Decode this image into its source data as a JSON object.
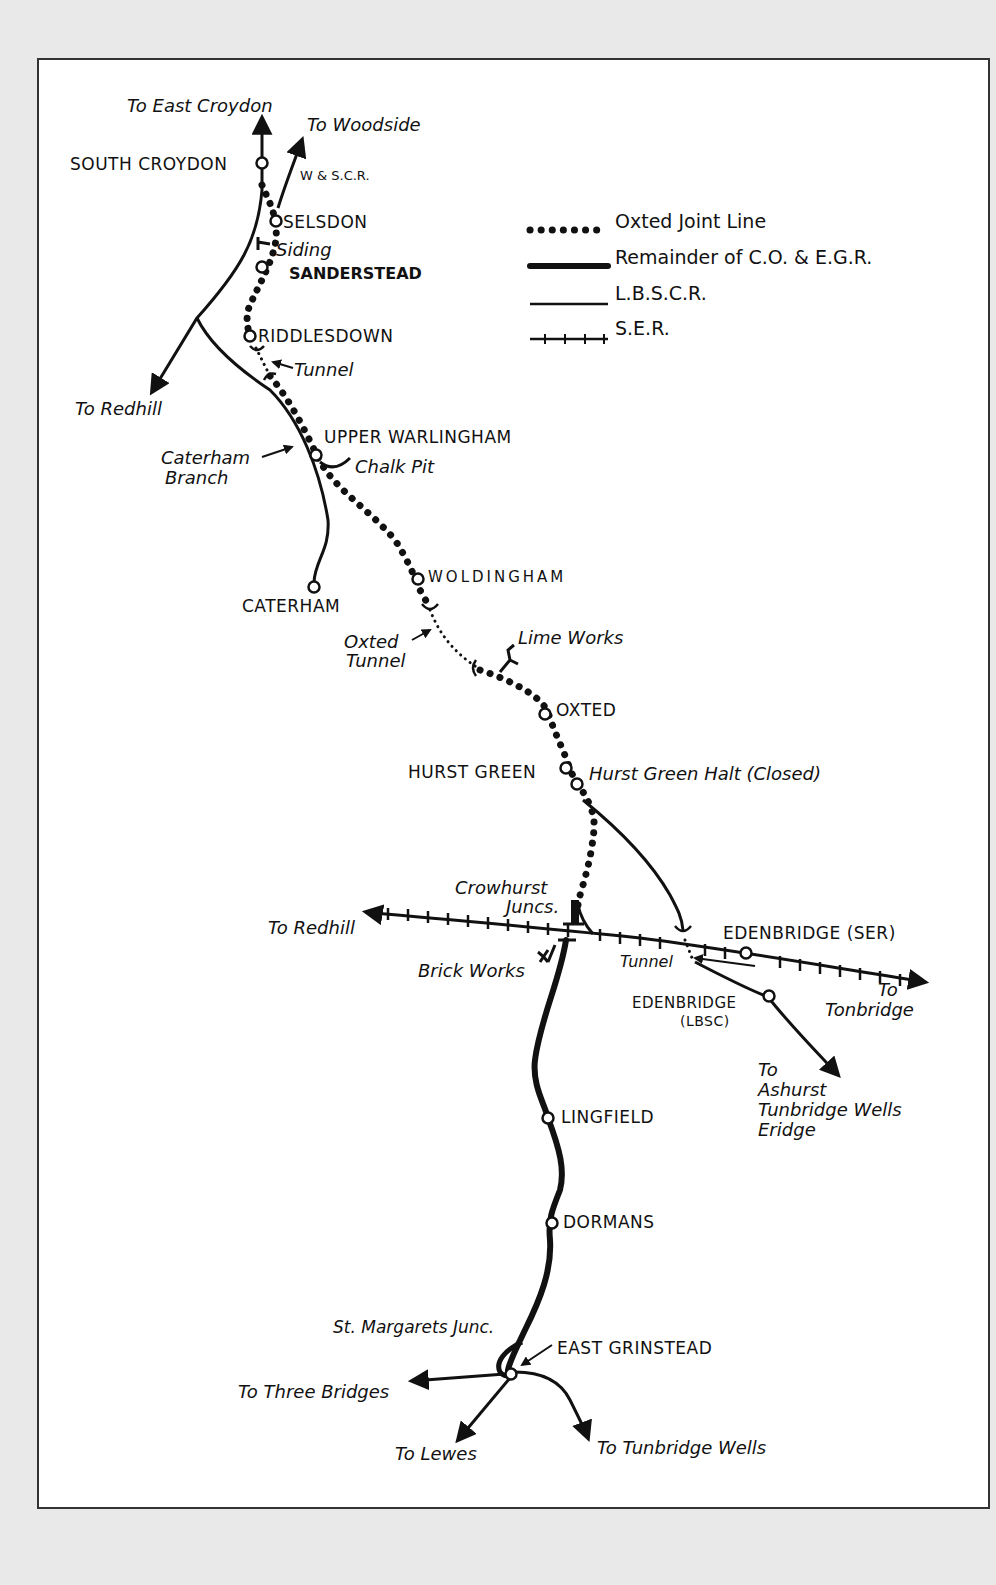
{
  "legend": {
    "items": [
      {
        "style": "dotted",
        "label": "Oxted Joint Line"
      },
      {
        "style": "thick",
        "label": "Remainder of C.O. & E.G.R."
      },
      {
        "style": "thin",
        "label": "L.B.S.C.R."
      },
      {
        "style": "ticked",
        "label": "S.E.R."
      }
    ]
  },
  "stations": {
    "south_croydon": "SOUTH CROYDON",
    "selsdon": "SELSDON",
    "sanderstead": "SANDERSTEAD",
    "riddlesdown": "RIDDLESDOWN",
    "upper_warlingham": "UPPER WARLINGHAM",
    "caterham": "CATERHAM",
    "woldingham": "WOLDINGHAM",
    "oxted": "OXTED",
    "hurst_green": "HURST GREEN",
    "edenbridge_ser": "EDENBRIDGE (SER)",
    "edenbridge_lbsc": "EDENBRIDGE",
    "edenbridge_lbsc_sub": "(LBSC)",
    "lingfield": "LINGFIELD",
    "dormans": "DORMANS",
    "east_grinstead": "EAST GRINSTEAD"
  },
  "annotations": {
    "to_east_croydon": "To East Croydon",
    "to_woodside": "To Woodside",
    "wscr": "W & S.C.R.",
    "siding": "Siding",
    "tunnel_riddlesdown": "Tunnel",
    "to_redhill_north": "To Redhill",
    "caterham_branch_1": "Caterham",
    "caterham_branch_2": "Branch",
    "chalk_pit": "Chalk Pit",
    "oxted_tunnel_1": "Oxted",
    "oxted_tunnel_2": "Tunnel",
    "lime_works": "Lime Works",
    "hurst_green_halt": "Hurst Green Halt (Closed)",
    "crowhurst_1": "Crowhurst",
    "crowhurst_2": "Juncs.",
    "to_redhill_west": "To Redhill",
    "brick_works": "Brick Works",
    "tunnel_edenbridge": "Tunnel",
    "to_tonbridge_1": "To",
    "to_tonbridge_2": "Tonbridge",
    "to_ashurst_1": "To",
    "to_ashurst_2": "Ashurst",
    "to_ashurst_3": "Tunbridge Wells",
    "to_ashurst_4": "Eridge",
    "st_margarets": "St. Margarets Junc.",
    "to_three_bridges": "To Three Bridges",
    "to_lewes": "To Lewes",
    "to_tunbridge_wells": "To Tunbridge Wells"
  },
  "colors": {
    "ink": "#111111",
    "paper": "#ffffff",
    "page_bg": "#e9e9e9",
    "frame": "#333333"
  }
}
